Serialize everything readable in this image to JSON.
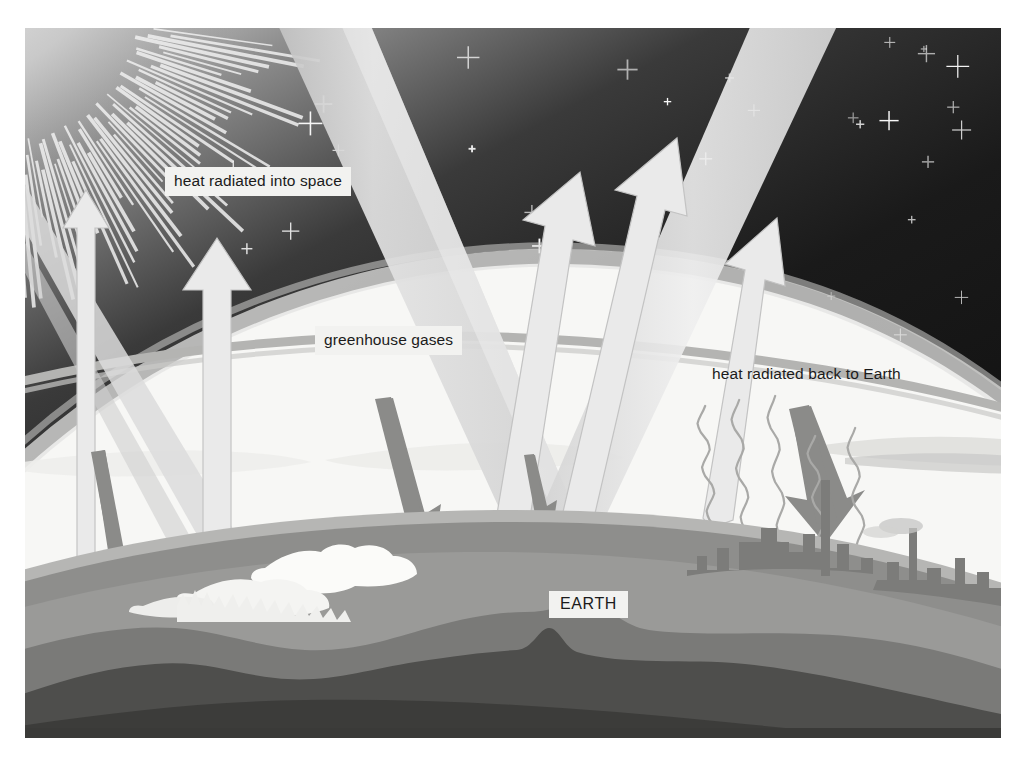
{
  "diagram": {
    "labels": {
      "heat_into_space": "heat radiated into space",
      "greenhouse_gases": "greenhouse gases",
      "heat_back_to_earth": "heat radiated back to Earth",
      "earth": "EARTH"
    },
    "colors": {
      "space_dark": "#161616",
      "space_mid": "#4a4a4a",
      "space_light": "#8d8d8d",
      "atmosphere_haze": "#f2f2f0",
      "atmosphere_band": "#b9b9b7",
      "beam_light": "#dedede",
      "beam_mid": "#cccccc",
      "arrow_down": "#8c8c8c",
      "arrow_up": "#e6e6e6",
      "terrain_light": "#b0b0ae",
      "terrain_mid": "#8a8a88",
      "terrain_dark": "#4f4f4f",
      "terrain_darkest": "#3a3a3a",
      "city": "#7e7e7c",
      "label_bg": "#f2f2f0",
      "label_text": "#1b1b1b",
      "star": "#ffffff",
      "page_bg": "#ffffff"
    },
    "elements": {
      "sun": "sun with radiating spikes, upper-left corner",
      "stars_count": 46,
      "incoming_beams": 3,
      "outgoing_arrows": 5,
      "downward_greenhouse_arrows": 4,
      "heat_squiggles": 5,
      "city_skyline": "industrial city silhouette on right",
      "ice_cap": "snow and ice formation on left"
    }
  }
}
